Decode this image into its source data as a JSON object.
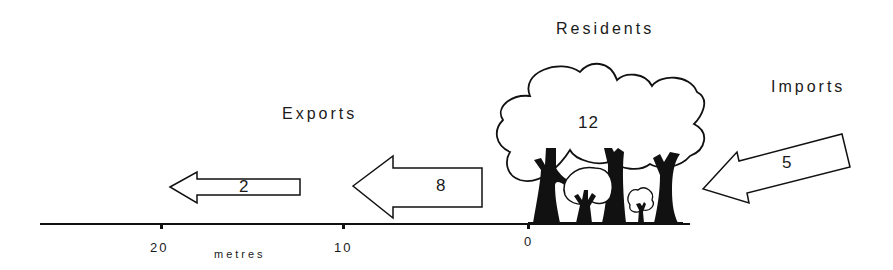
{
  "diagram": {
    "labels": {
      "residents": "Residents",
      "imports": "Imports",
      "exports": "Exports"
    },
    "values": {
      "residents": "12",
      "imports": "5",
      "export_near": "8",
      "export_far": "2"
    },
    "axis": {
      "unit": "metres",
      "ticks": [
        "20",
        "10",
        "0"
      ]
    },
    "colors": {
      "ink": "#111111",
      "background": "#ffffff"
    }
  }
}
